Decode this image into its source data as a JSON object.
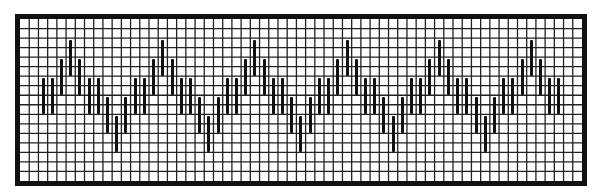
{
  "diagram": {
    "type": "chart-grid-pattern",
    "grid": {
      "columns": 61,
      "rows": 17,
      "cell_width": 9.213,
      "cell_height": 9.53,
      "line_color": "#222222",
      "frame_color": "#111111",
      "background": "#ffffff"
    },
    "bar": {
      "length_rows": 4,
      "color": "#111111"
    },
    "pattern": {
      "start_column": 2,
      "end_column": 58,
      "period": 10,
      "top_rows_by_phase": [
        6,
        6,
        4,
        2,
        4,
        6,
        6,
        8,
        10,
        8
      ]
    }
  }
}
